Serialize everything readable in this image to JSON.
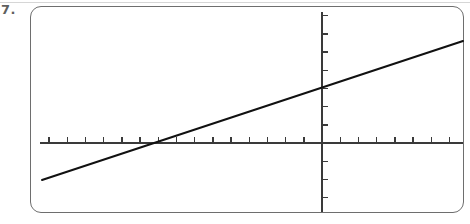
{
  "page": {
    "background_color": "#ffffff",
    "width": 470,
    "height": 224
  },
  "top_rule": {
    "color": "#d6d6d6"
  },
  "problem": {
    "number_label": "7."
  },
  "frame": {
    "border_color": "#6e6e6e",
    "fill_color": "#ffffff",
    "corner_radius": 11
  },
  "chart_data": {
    "type": "line",
    "title": "",
    "subtitle": "",
    "xlabel": "",
    "ylabel": "",
    "grid": false,
    "legend": null,
    "axis_color": "#3a3a3a",
    "line_color": "#111111",
    "line_width": 2,
    "axis_width": 1.2,
    "tick_length": 6,
    "tick_width": 1.4,
    "tick_spacing_px": 18.2,
    "axes": {
      "x_axis": {
        "screen_y": 143,
        "x_start": 40,
        "x_end": 463,
        "ticks_direction": "up",
        "tick_count": 24
      },
      "y_axis": {
        "screen_x": 322,
        "y_start": 12,
        "y_end": 212,
        "ticks_direction": "right",
        "tick_count": 11
      }
    },
    "xlim": [
      -15.5,
      7.75
    ],
    "ylim": [
      -3.8,
      7.2
    ],
    "series": [
      {
        "name": "line",
        "equation": "y = 0.33x + 2.03",
        "slope": 0.33,
        "y_intercept": 2.03,
        "x_intercept": -6.15,
        "screen_points": [
          {
            "x": 42,
            "y": 180
          },
          {
            "x": 463,
            "y": 41
          }
        ],
        "data_points": [
          {
            "x": -15.4,
            "y": -2.03
          },
          {
            "x": 7.75,
            "y": 4.58
          }
        ]
      }
    ]
  }
}
